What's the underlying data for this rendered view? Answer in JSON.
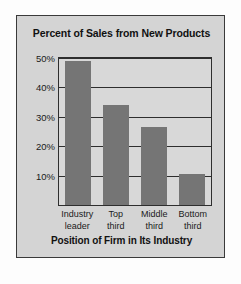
{
  "chart_data": {
    "type": "bar",
    "title": "Percent of Sales from New Products",
    "xlabel": "Position of Firm in Its Industry",
    "ylabel": "",
    "categories": [
      "Industry leader",
      "Top third",
      "Middle third",
      "Bottom third"
    ],
    "category_lines": [
      [
        "Industry",
        "leader"
      ],
      [
        "Top",
        "third"
      ],
      [
        "Middle",
        "third"
      ],
      [
        "Bottom",
        "third"
      ]
    ],
    "values": [
      49,
      34,
      26.5,
      10.5
    ],
    "ylim": [
      0,
      50
    ],
    "yticks": [
      10,
      20,
      30,
      40,
      50
    ],
    "ytick_labels": [
      "10%",
      "20%",
      "30%",
      "40%",
      "50%"
    ],
    "grid": true,
    "legend": "none",
    "bar_color": "#757575",
    "plot_background": "#d8d8d8",
    "panel_background": "#d4d4d4",
    "border_color": "#2e2e2e",
    "text_color": "#111111"
  }
}
